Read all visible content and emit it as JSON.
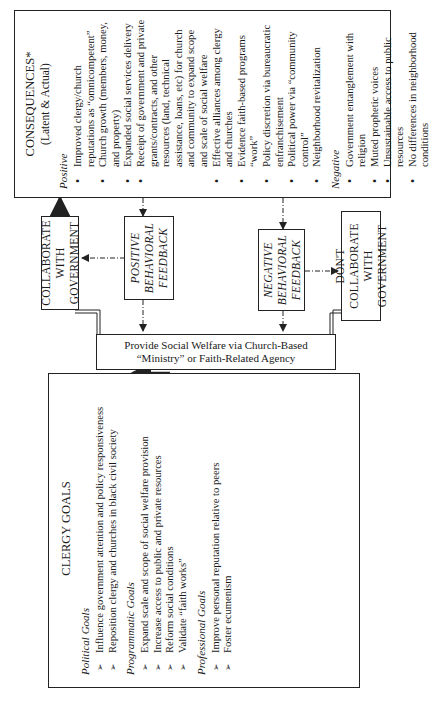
{
  "diagram": {
    "orientation": "rotated 90 degrees counter-clockwise",
    "clergy_goals": {
      "title": "CLERGY GOALS",
      "sections": [
        {
          "heading": "Political Goals",
          "items": [
            "Influence government attention and policy responsiveness",
            "Reposition clergy and churches in black civil society"
          ]
        },
        {
          "heading": "Programmatic Goals",
          "items": [
            "Expand scale and scope of social welfare provision",
            "Increase access to public and private resources",
            "Reform social conditions",
            "Validate “faith works”"
          ]
        },
        {
          "heading": "Professional Goals",
          "items": [
            "Improve personal reputation relative to peers",
            "Foster ecumenism"
          ]
        }
      ]
    },
    "provide_box": {
      "line1": "Provide Social Welfare via Church-Based",
      "line2": "“Ministry” or Faith-Related Agency"
    },
    "collaborate_box": {
      "line1": "COLLABORATE WITH",
      "line2": "GOVERNMENT"
    },
    "dont_collaborate_box": {
      "line1": "DON'T COLLABORATE",
      "line2": "WITH GOVERNMENT"
    },
    "positive_feedback_box": {
      "line1": "POSITIVE",
      "line2": "BEHAVIORAL",
      "line3": "FEEDBACK"
    },
    "negative_feedback_box": {
      "line1": "NEGATIVE",
      "line2": "BEHAVIORAL",
      "line3": "FEEDBACK"
    },
    "consequences": {
      "title": "CONSEQUENCES*",
      "subtitle": "(Latent & Actual)",
      "positive_heading": "Positive",
      "positive_items": [
        "Improved clergy/church reputations as “omnicompetent”",
        "Church growth (members, money, and property)",
        "Expanded social services delivery",
        "Receipt of government and private grants/contracts, and other resources (land, technical assistance, loans, etc) for church and community to expand scope and scale of social welfare",
        "Effective alliances among clergy and churches",
        "Evidence faith-based programs “work”",
        "Policy discretion via bureaucratic enfranchisement",
        "Political power via “community control”",
        "Neighborhood revitalization"
      ],
      "negative_heading": "Negative",
      "negative_items": [
        "Government entanglement with religion",
        "Muted prophetic voices",
        "Unsustainable access to public resources",
        "No differences in neighborhood conditions"
      ]
    },
    "colors": {
      "line": "#222222",
      "background": "#ffffff",
      "text": "#1a1a1a"
    }
  }
}
